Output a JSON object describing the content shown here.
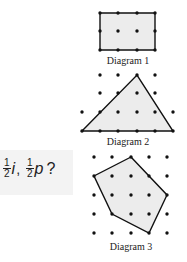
{
  "question": {
    "fraction1": {
      "numerator": "1",
      "denominator": "2",
      "variable": "i"
    },
    "separator": ",",
    "fraction2": {
      "numerator": "1",
      "denominator": "2",
      "variable": "p"
    },
    "end": "?",
    "background": "#f3f3f3"
  },
  "diagrams": [
    {
      "label": "Diagram 1",
      "shape": "rectangle",
      "dots": [
        [
          100,
          13
        ],
        [
          118,
          13
        ],
        [
          137,
          13
        ],
        [
          155,
          13
        ],
        [
          100,
          31
        ],
        [
          118,
          31
        ],
        [
          137,
          31
        ],
        [
          155,
          31
        ],
        [
          100,
          50
        ],
        [
          118,
          50
        ],
        [
          137,
          50
        ],
        [
          155,
          50
        ]
      ],
      "polygon": [
        [
          100,
          13
        ],
        [
          155,
          13
        ],
        [
          155,
          50
        ],
        [
          100,
          50
        ]
      ]
    },
    {
      "label": "Diagram 2",
      "shape": "triangle",
      "dots": [
        [
          100,
          75
        ],
        [
          118,
          75
        ],
        [
          137,
          75
        ],
        [
          155,
          75
        ],
        [
          100,
          93
        ],
        [
          118,
          93
        ],
        [
          137,
          93
        ],
        [
          155,
          93
        ],
        [
          82,
          112
        ],
        [
          100,
          112
        ],
        [
          118,
          112
        ],
        [
          137,
          112
        ],
        [
          155,
          112
        ],
        [
          173,
          112
        ],
        [
          82,
          131
        ],
        [
          100,
          131
        ],
        [
          118,
          131
        ],
        [
          137,
          131
        ],
        [
          155,
          131
        ],
        [
          173,
          131
        ]
      ],
      "polygon": [
        [
          82,
          131
        ],
        [
          137,
          75
        ],
        [
          173,
          131
        ]
      ]
    },
    {
      "label": "Diagram 3",
      "shape": "pentagon",
      "dots": [
        [
          94,
          157
        ],
        [
          112,
          157
        ],
        [
          131,
          157
        ],
        [
          149,
          157
        ],
        [
          167,
          157
        ],
        [
          94,
          176
        ],
        [
          112,
          176
        ],
        [
          131,
          176
        ],
        [
          149,
          176
        ],
        [
          167,
          176
        ],
        [
          94,
          195
        ],
        [
          112,
          195
        ],
        [
          131,
          195
        ],
        [
          149,
          195
        ],
        [
          167,
          195
        ],
        [
          94,
          214
        ],
        [
          112,
          214
        ],
        [
          131,
          214
        ],
        [
          149,
          214
        ],
        [
          167,
          214
        ],
        [
          94,
          233
        ],
        [
          112,
          233
        ],
        [
          131,
          233
        ],
        [
          149,
          233
        ],
        [
          167,
          233
        ]
      ],
      "polygon": [
        [
          131,
          157
        ],
        [
          167,
          195
        ],
        [
          149,
          233
        ],
        [
          112,
          214
        ],
        [
          94,
          176
        ]
      ]
    }
  ],
  "colors": {
    "fill": "#ececec",
    "stroke": "#111111",
    "dot": "#111111"
  }
}
